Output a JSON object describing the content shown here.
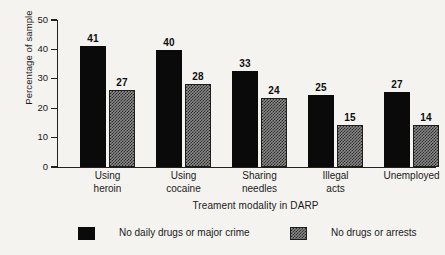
{
  "chart_data": {
    "type": "bar",
    "title": "",
    "xlabel": "Treament modality in DARP",
    "ylabel": "Percentage of sample",
    "categories": [
      "Using heroin",
      "Using cocaine",
      "Sharing needles",
      "Illegal acts",
      "Unemployed"
    ],
    "category_lines": [
      [
        "Using",
        "heroin"
      ],
      [
        "Using",
        "cocaine"
      ],
      [
        "Sharing",
        "needles"
      ],
      [
        "Illegal",
        "acts"
      ],
      [
        "Unemployed"
      ]
    ],
    "series": [
      {
        "name": "No daily drugs or major crime",
        "values": [
          41,
          40,
          33,
          25,
          27
        ],
        "drawn_values": [
          41,
          39.8,
          32.8,
          24.5,
          25.6
        ],
        "style": "solid-black",
        "color": "#0a0a0a"
      },
      {
        "name": "No drugs or arrests",
        "values": [
          27,
          28,
          24,
          15,
          14
        ],
        "drawn_values": [
          26.1,
          28.2,
          23.5,
          14.3,
          14.4
        ],
        "style": "checkered-gray",
        "color": "#8c8c8c"
      }
    ],
    "ylim": [
      0,
      50
    ],
    "yticks": [
      0,
      10,
      20,
      30,
      40,
      50
    ],
    "ytick_labels": [
      "0",
      "10",
      "20",
      "30",
      "40",
      "50"
    ],
    "grid": false,
    "legend_position": "bottom",
    "value_labels_shown": true
  },
  "legend": {
    "items": [
      {
        "label": "No daily drugs or major crime",
        "swatch": "solid-black-swatch"
      },
      {
        "label": "No drugs or arrests",
        "swatch": "checkered-gray-swatch"
      }
    ]
  }
}
